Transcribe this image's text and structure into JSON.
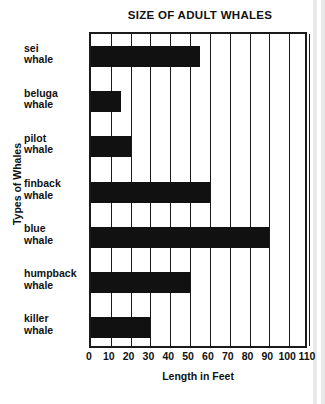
{
  "chart_data": {
    "type": "bar",
    "orientation": "horizontal",
    "title": "SIZE OF ADULT WHALES",
    "xlabel": "Length in Feet",
    "ylabel": "Types of Whales",
    "categories": [
      "sei whale",
      "beluga whale",
      "pilot whale",
      "finback whale",
      "blue whale",
      "humpback whale",
      "killer whale"
    ],
    "category_lines": [
      [
        "sei",
        "whale"
      ],
      [
        "beluga",
        "whale"
      ],
      [
        "pilot",
        "whale"
      ],
      [
        "finback",
        "whale"
      ],
      [
        "blue",
        "whale"
      ],
      [
        "humpback",
        "whale"
      ],
      [
        "killer",
        "whale"
      ]
    ],
    "values": [
      55,
      15,
      20,
      60,
      90,
      50,
      30
    ],
    "xlim": [
      0,
      110
    ],
    "xticks": [
      0,
      10,
      20,
      30,
      40,
      50,
      60,
      70,
      80,
      90,
      100,
      110
    ],
    "xtick_labels": [
      "0",
      "10",
      "20",
      "30",
      "40",
      "50",
      "60",
      "70",
      "80",
      "90",
      "100",
      "110"
    ],
    "grid": "vertical",
    "legend": "none",
    "bar_color": "#111111",
    "frame_color": "#1a1a1a",
    "background": "#ffffff"
  }
}
